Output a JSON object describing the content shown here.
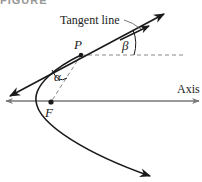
{
  "figure": {
    "caption_partial": "FIGURE",
    "labels": {
      "tangent_line": "Tangent line",
      "point_p": "P",
      "focus": "F",
      "axis": "Axis",
      "alpha": "α",
      "beta": "β"
    },
    "colors": {
      "curve": "#1a1a1a",
      "tangent": "#1a1a1a",
      "axis": "#777777",
      "dashed": "#888888",
      "text": "#222222"
    },
    "geometry": {
      "P": [
        81,
        55
      ],
      "F": [
        51,
        102
      ],
      "axis_y": 101,
      "vertex": [
        36,
        101
      ]
    }
  }
}
